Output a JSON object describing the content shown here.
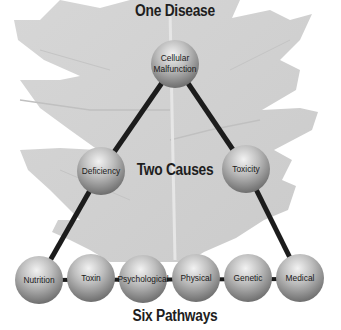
{
  "diagram": {
    "headings": {
      "top": "One Disease",
      "middle": "Two Causes",
      "bottom": "Six Pathways"
    },
    "nodes": {
      "root": {
        "label_line1": "Cellular",
        "label_line2": "Malfunction"
      },
      "causes": [
        {
          "label": "Deficiency"
        },
        {
          "label": "Toxicity"
        }
      ],
      "pathways": [
        {
          "label": "Nutrition"
        },
        {
          "label": "Toxin"
        },
        {
          "label": "Psychological"
        },
        {
          "label": "Physical"
        },
        {
          "label": "Genetic"
        },
        {
          "label": "Medical"
        }
      ]
    },
    "colors": {
      "leaf_background": "#d9d9d9",
      "sphere_light": "#e8e8e8",
      "sphere_dark": "#7a7a7a",
      "connector": "#1c1c1c",
      "text": "#1e1e1e"
    }
  }
}
